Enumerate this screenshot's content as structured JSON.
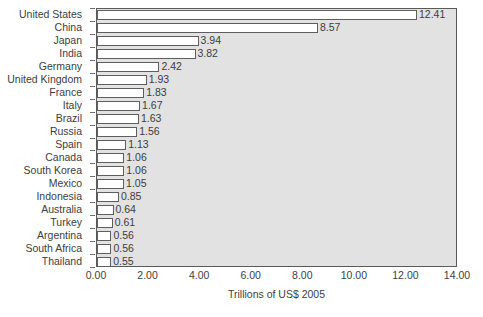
{
  "chart_data": {
    "type": "bar",
    "orientation": "horizontal",
    "title": "",
    "subtitle": "",
    "xlabel": "Trillions of US$ 2005",
    "ylabel": "",
    "xlim": [
      0.0,
      14.0
    ],
    "xticks": [
      "0.00",
      "2.00",
      "4.00",
      "6.00",
      "8.00",
      "10.00",
      "12.00",
      "14.00"
    ],
    "xtick_values": [
      0.0,
      2.0,
      4.0,
      6.0,
      8.0,
      10.0,
      12.0,
      14.0
    ],
    "grid": false,
    "legend": null,
    "categories": [
      "United States",
      "China",
      "Japan",
      "India",
      "Germany",
      "United Kingdom",
      "France",
      "Italy",
      "Brazil",
      "Russia",
      "Spain",
      "Canada",
      "South Korea",
      "Mexico",
      "Indonesia",
      "Australia",
      "Turkey",
      "Argentina",
      "South Africa",
      "Thailand"
    ],
    "values": [
      12.41,
      8.57,
      3.94,
      3.82,
      2.42,
      1.93,
      1.83,
      1.67,
      1.63,
      1.56,
      1.13,
      1.06,
      1.06,
      1.05,
      0.85,
      0.64,
      0.61,
      0.56,
      0.56,
      0.55
    ],
    "value_labels": [
      "12.41",
      "8.57",
      "3.94",
      "3.82",
      "2.42",
      "1.93",
      "1.83",
      "1.67",
      "1.63",
      "1.56",
      "1.13",
      "1.06",
      "1.06",
      "1.05",
      "0.85",
      "0.64",
      "0.61",
      "0.56",
      "0.56",
      "0.55"
    ],
    "colors": {
      "bar_fill": "#ffffff",
      "bar_border": "#5e5e5e",
      "plot_background": "#e2e2e2",
      "plot_border": "#5a5a5a",
      "page_background": "#ffffff",
      "text": "#3d3d3d"
    }
  }
}
